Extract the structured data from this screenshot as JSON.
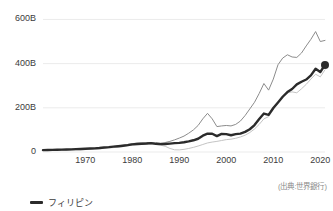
{
  "chart_data": {
    "type": "line",
    "title": "",
    "subtitle": "",
    "xlabel": "",
    "ylabel": "",
    "xlim": [
      1961,
      2021
    ],
    "ylim": [
      0,
      620
    ],
    "grid": true,
    "grid_axis": "y",
    "legend_position": "bottom-left",
    "unit": "USD",
    "value_suffix": "B",
    "source_note": "(出典:世界銀行)",
    "y_ticks": [
      0,
      200,
      400,
      600
    ],
    "y_tick_labels": [
      "0",
      "200B",
      "400B",
      "600B"
    ],
    "x_ticks": [
      1970,
      1980,
      1990,
      2000,
      2010,
      2020
    ],
    "x_tick_labels": [
      "1970",
      "1980",
      "1990",
      "2000",
      "2010",
      "2020"
    ],
    "x": [
      1961,
      1962,
      1963,
      1964,
      1965,
      1966,
      1967,
      1968,
      1969,
      1970,
      1971,
      1972,
      1973,
      1974,
      1975,
      1976,
      1977,
      1978,
      1979,
      1980,
      1981,
      1982,
      1983,
      1984,
      1985,
      1986,
      1987,
      1988,
      1989,
      1990,
      1991,
      1992,
      1993,
      1994,
      1995,
      1996,
      1997,
      1998,
      1999,
      2000,
      2001,
      2002,
      2003,
      2004,
      2005,
      2006,
      2007,
      2008,
      2009,
      2010,
      2011,
      2012,
      2013,
      2014,
      2015,
      2016,
      2017,
      2018,
      2019,
      2020,
      2021
    ],
    "series": [
      {
        "name": "フィリピン",
        "color": "#2b2b2b",
        "width": 2.4,
        "marker_last": true,
        "highlighted": true,
        "values": [
          8.3,
          8.9,
          9.6,
          10.0,
          10.6,
          11.2,
          12.0,
          12.8,
          13.6,
          14.5,
          15.6,
          16.4,
          18.0,
          20.4,
          22.0,
          24.5,
          26.3,
          28.4,
          31.0,
          34.5,
          36.0,
          37.5,
          38.5,
          40.0,
          37.0,
          35.5,
          36.0,
          38.0,
          40.0,
          41.5,
          44.0,
          48.0,
          53.0,
          60.0,
          74.0,
          83.0,
          82.5,
          72.0,
          82.0,
          81.0,
          76.0,
          81.0,
          83.0,
          91.0,
          103.0,
          122.0,
          149.0,
          174.0,
          168.0,
          199.0,
          224.0,
          250.0,
          271.0,
          285.0,
          306.0,
          318.0,
          328.0,
          347.0,
          377.0,
          362.0,
          394.0
        ]
      },
      {
        "name": "upper-comparison",
        "color": "#8c8c8c",
        "width": 1.0,
        "marker_last": false,
        "highlighted": false,
        "values": [
          7.5,
          8.0,
          8.6,
          9.0,
          9.6,
          10.2,
          11.0,
          11.8,
          12.6,
          13.5,
          14.5,
          15.5,
          17.5,
          20.0,
          22.0,
          25.0,
          27.5,
          30.5,
          34.0,
          38.0,
          40.0,
          41.0,
          42.0,
          43.0,
          41.0,
          40.0,
          43.0,
          48.0,
          55.0,
          63.0,
          72.0,
          85.0,
          100.0,
          120.0,
          150.0,
          175.0,
          150.0,
          115.0,
          118.0,
          120.0,
          118.0,
          125.0,
          140.0,
          165.0,
          195.0,
          225.0,
          265.0,
          310.0,
          280.0,
          330.0,
          395.0,
          425.0,
          440.0,
          430.0,
          428.0,
          448.0,
          480.0,
          510.0,
          545.0,
          500.0,
          505.0
        ]
      },
      {
        "name": "lower-comparison",
        "color": "#c4c4c4",
        "width": 1.0,
        "marker_last": false,
        "highlighted": false,
        "values": [
          6.5,
          6.8,
          7.2,
          7.6,
          8.0,
          8.5,
          9.0,
          9.6,
          10.2,
          11.0,
          12.0,
          13.0,
          14.5,
          16.5,
          18.0,
          20.0,
          22.0,
          24.5,
          27.5,
          31.0,
          33.0,
          34.5,
          35.5,
          36.0,
          34.0,
          31.0,
          26.0,
          16.0,
          10.0,
          9.5,
          12.0,
          16.0,
          21.0,
          27.0,
          34.0,
          41.0,
          45.0,
          48.0,
          52.0,
          56.0,
          58.0,
          62.0,
          68.0,
          76.0,
          88.0,
          104.0,
          125.0,
          150.0,
          160.0,
          192.0,
          224.0,
          250.0,
          268.0,
          272.0,
          268.0,
          286.0,
          306.0,
          330.0,
          352.0,
          340.0,
          372.0
        ]
      }
    ]
  },
  "legend": {
    "items": [
      {
        "label": "フィリピン",
        "color": "#2b2b2b"
      }
    ]
  },
  "source": {
    "text": "(出典:世界銀行)"
  },
  "axis": {
    "y_labels": [
      "600B",
      "400B",
      "200B",
      "0"
    ],
    "x_labels": [
      "1970",
      "1980",
      "1990",
      "2000",
      "2010",
      "2020"
    ]
  },
  "colors": {
    "grid": "#ebebeb",
    "text": "#3c3c3c",
    "muted_text": "#8a8a8a",
    "background": "#ffffff"
  }
}
